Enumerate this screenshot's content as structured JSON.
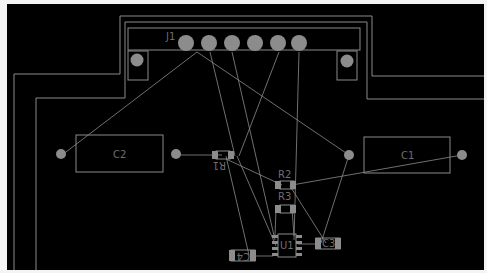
{
  "view": {
    "type": "PCB layout editor",
    "background": "#000000",
    "outline_color": "#8a8a8a",
    "pad_color": "#8c8c8c",
    "ratsnest_color": "#8c8c8c",
    "label_color": "#6e6e6e"
  },
  "components": {
    "J1": {
      "label": "J1",
      "pins": 6
    },
    "C1": {
      "label": "C1"
    },
    "C2": {
      "label": "C2"
    },
    "C3": {
      "label": "C3"
    },
    "C4": {
      "label": "C4"
    },
    "R1": {
      "label": "R1"
    },
    "R2": {
      "label": "R2"
    },
    "R3": {
      "label": "R3"
    },
    "U1": {
      "label": "U1",
      "pins": 8
    }
  }
}
